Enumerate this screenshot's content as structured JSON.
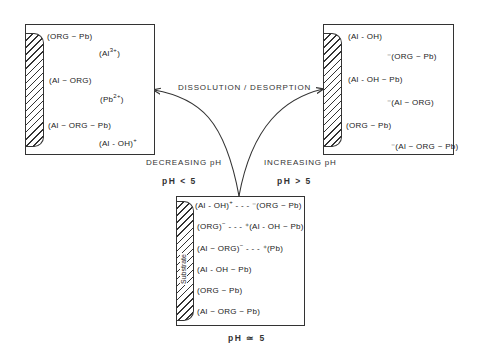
{
  "caption": "DISSOLUTION / DESORPTION",
  "left_panel": {
    "labels": [
      {
        "pre": "",
        "text": "(ORG ~ Pb)",
        "sup": "",
        "post": ""
      },
      {
        "pre": "",
        "text": "(Al",
        "sup": "3+",
        "post": ")"
      },
      {
        "pre": "",
        "text": "(Al ~ ORG)",
        "sup": "",
        "post": ""
      },
      {
        "pre": "",
        "text": "(Pb",
        "sup": "2+",
        "post": ")"
      },
      {
        "pre": "",
        "text": "(Al ~ ORG ~ Pb)",
        "sup": "",
        "post": ""
      },
      {
        "pre": "",
        "text": "(Al - OH)",
        "sup": "+",
        "post": ""
      }
    ],
    "direction": "DECREASING pH",
    "condition": "pH < 5"
  },
  "right_panel": {
    "labels": [
      {
        "text": "(Al - OH)"
      },
      {
        "text": "⁻(ORG ~ Pb)"
      },
      {
        "text": "(Al - OH ~ Pb)"
      },
      {
        "text": "⁻(Al ~ ORG)"
      },
      {
        "text": "(ORG ~ Pb)"
      },
      {
        "text": "⁻(Al ~ ORG ~ Pb)"
      }
    ],
    "direction": "INCREASING pH",
    "condition": "pH > 5"
  },
  "center_panel": {
    "substrate_label": "Substrate",
    "labels": [
      {
        "a": "(Al - OH)",
        "asup": "+",
        "b": " - - - ⁻(ORG ~ Pb)"
      },
      {
        "a": "(ORG)",
        "asup": "−",
        "b": " - - - ⁺(Al - OH ~ Pb)"
      },
      {
        "a": "(Al ~ ORG)",
        "asup": "−",
        "b": " - - - ⁺(Pb)"
      },
      {
        "a": "(Al - OH ~ Pb)",
        "asup": "",
        "b": ""
      },
      {
        "a": "(ORG ~ Pb)",
        "asup": "",
        "b": ""
      },
      {
        "a": "(Al ~ ORG ~ Pb)",
        "asup": "",
        "b": ""
      }
    ],
    "condition": "pH ≃ 5"
  }
}
